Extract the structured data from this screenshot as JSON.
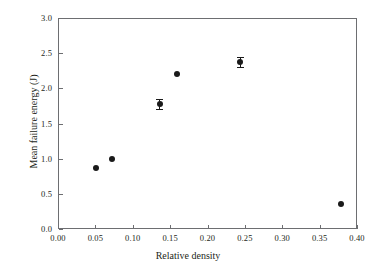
{
  "chart_data": {
    "type": "scatter",
    "title": "",
    "subtitle": "",
    "xlabel": "Relative density",
    "ylabel": "Mean failure energy (J)",
    "xlim": [
      0.0,
      0.4
    ],
    "ylim": [
      0.0,
      3.0
    ],
    "xticks": [
      0.0,
      0.05,
      0.1,
      0.15,
      0.2,
      0.25,
      0.3,
      0.35,
      0.4
    ],
    "yticks": [
      0.0,
      0.5,
      1.0,
      1.5,
      2.0,
      2.5,
      3.0
    ],
    "xticklabels": [
      "0.00",
      "0.05",
      "0.10",
      "0.15",
      "0.20",
      "0.25",
      "0.30",
      "0.35",
      "0.40"
    ],
    "yticklabels": [
      "0.0",
      "0.5",
      "1.0",
      "1.5",
      "2.0",
      "2.5",
      "3.0"
    ],
    "grid": false,
    "legend": null,
    "marker": "filled-circle",
    "marker_color": "#1a1a1a",
    "axis_color": "#6d6e71",
    "background": "#ffffff",
    "points": [
      {
        "x": 0.051,
        "y": 0.87,
        "yerr": 0.0
      },
      {
        "x": 0.072,
        "y": 1.0,
        "yerr": 0.0
      },
      {
        "x": 0.136,
        "y": 1.78,
        "yerr": 0.07
      },
      {
        "x": 0.159,
        "y": 2.2,
        "yerr": 0.0
      },
      {
        "x": 0.244,
        "y": 2.38,
        "yerr": 0.07
      },
      {
        "x": 0.379,
        "y": 0.36,
        "yerr": 0.0
      }
    ]
  }
}
